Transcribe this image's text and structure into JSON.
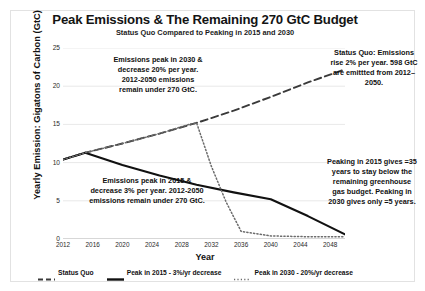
{
  "chart_data": {
    "type": "line",
    "title": "Peak Emissions & The Remaining 270 GtC Budget",
    "subtitle": "Status Quo Compared to Peaking in 2015 and 2030",
    "xlabel": "Year",
    "ylabel": "Yearly Emission: Gigatons of Carbon (GtC)",
    "xlim": [
      2012,
      2050
    ],
    "ylim": [
      0,
      25
    ],
    "xticks": [
      2012,
      2016,
      2020,
      2024,
      2028,
      2032,
      2036,
      2040,
      2044,
      2048
    ],
    "yticks": [
      0,
      5,
      10,
      15,
      20,
      25
    ],
    "grid": true,
    "legend_position": "bottom",
    "series": [
      {
        "name": "Status Quo",
        "style": "dashed",
        "color": "#3a3a3a",
        "x": [
          2012,
          2015,
          2020,
          2025,
          2030,
          2035,
          2040,
          2045,
          2050
        ],
        "values": [
          10.4,
          11.3,
          12.5,
          13.8,
          15.2,
          16.8,
          18.6,
          20.5,
          22.2
        ]
      },
      {
        "name": "Peak in 2015 - 3%/yr decrease",
        "style": "solid",
        "color": "#111111",
        "x": [
          2012,
          2015,
          2020,
          2025,
          2030,
          2035,
          2040,
          2045,
          2050
        ],
        "values": [
          10.4,
          11.3,
          9.7,
          8.3,
          7.1,
          6.1,
          5.2,
          3.0,
          0.6
        ]
      },
      {
        "name": "Peak in 2030 - 20%/yr decrease",
        "style": "dotted",
        "color": "#6b6b6b",
        "x": [
          2012,
          2015,
          2020,
          2025,
          2029,
          2030,
          2032,
          2034,
          2036,
          2040,
          2045,
          2050
        ],
        "values": [
          10.4,
          11.3,
          12.5,
          13.8,
          15.0,
          15.2,
          9.5,
          4.8,
          1.0,
          0.4,
          0.3,
          0.3
        ]
      }
    ],
    "annotations": [
      {
        "id": "note-2030",
        "text": "Emissions peak in 2030 & decrease 20% per year. 2012-2050 emissions remain under 270 GtC."
      },
      {
        "id": "note-2015",
        "text": "Emissions peak in 2015 & decrease 3% per year. 2012-2050 emissions remain under 270 GtC."
      },
      {
        "id": "note-status-quo",
        "text": "Status Quo: Emissions rise 2% per year. 598 GtC are emittted from 2012–2050."
      },
      {
        "id": "note-peaking",
        "text": "Peaking in 2015 gives =35 years to stay below the remaining greenhouse gas budget. Peaking in 2030 gives only =5 years."
      }
    ]
  }
}
